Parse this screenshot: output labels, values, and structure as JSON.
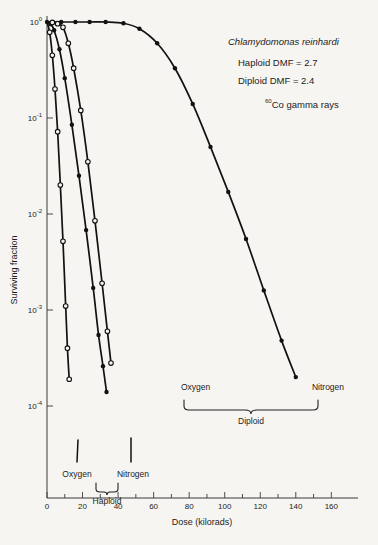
{
  "chart_data": {
    "type": "line",
    "title": "",
    "xlabel": "Dose (kilorads)",
    "ylabel": "Surviving fraction",
    "xlim": [
      0,
      175
    ],
    "ylim": [
      2e-05,
      1.2
    ],
    "yscale": "log",
    "grid": false,
    "legend_position": "none",
    "x_ticks_major": [
      0,
      20,
      40,
      60,
      80,
      100,
      120,
      140,
      160
    ],
    "x_tick_labels": [
      "0",
      "20",
      "40",
      "60",
      "80",
      "100",
      "120",
      "140",
      "160"
    ],
    "x_ticks_minor": [
      10,
      30,
      50,
      70,
      90,
      110,
      130,
      150
    ],
    "y_ticks": [
      1,
      0.1,
      0.01,
      0.001,
      0.0001
    ],
    "y_tick_labels": [
      "10",
      "10",
      "10",
      "10",
      "10"
    ],
    "y_tick_exponents": [
      "0",
      "-1",
      "-2",
      "-3",
      "-4"
    ],
    "series": [
      {
        "name": "Oxygen Haploid",
        "marker": "open-circle",
        "label": "Oxygen",
        "group": "Haploid",
        "x": [
          0,
          1.5,
          3,
          4.5,
          6,
          7.5,
          9,
          10.5,
          11.5,
          12.5
        ],
        "y": [
          1.0,
          0.78,
          0.45,
          0.2,
          0.072,
          0.02,
          0.0052,
          0.0011,
          0.0004,
          0.00019
        ]
      },
      {
        "name": "Nitrogen Haploid",
        "marker": "filled-circle",
        "label": "Nitrogen",
        "group": "Haploid",
        "x": [
          0,
          2,
          4,
          7,
          10,
          14,
          18,
          22,
          26,
          29,
          31.5,
          33.5
        ],
        "y": [
          1.0,
          0.95,
          0.82,
          0.52,
          0.26,
          0.085,
          0.025,
          0.0068,
          0.0017,
          0.00055,
          0.00026,
          0.00014
        ]
      },
      {
        "name": "Oxygen Diploid",
        "marker": "open-circle",
        "label": "Oxygen",
        "group": "Diploid",
        "x": [
          0,
          3,
          6,
          9,
          12,
          15,
          19,
          23,
          27,
          31,
          34,
          36
        ],
        "y": [
          1.0,
          0.99,
          0.96,
          0.88,
          0.6,
          0.33,
          0.12,
          0.035,
          0.0085,
          0.0019,
          0.0006,
          0.00028
        ]
      },
      {
        "name": "Nitrogen Diploid",
        "marker": "filled-circle",
        "label": "Nitrogen",
        "group": "Diploid",
        "x": [
          0,
          8,
          16,
          24,
          33,
          43,
          52,
          62,
          72,
          82,
          92,
          102,
          112,
          122,
          132,
          140
        ],
        "y": [
          1.0,
          1.0,
          1.0,
          1.0,
          1.0,
          0.97,
          0.85,
          0.6,
          0.33,
          0.14,
          0.05,
          0.017,
          0.0055,
          0.0016,
          0.00048,
          0.0002
        ]
      }
    ]
  },
  "annotation": {
    "species": "Chlamydomonas reinhardi",
    "haploid_dmf": "Haploid  DMF =  2.7",
    "diploid_dmf": "Diploid   DMF =  2.4",
    "source_sup": "60",
    "source_text": "Co gamma rays"
  },
  "group_labels": {
    "haploid": "Haploid",
    "diploid": "Diploid"
  },
  "axis": {
    "x_title": "Dose (kilorads)",
    "y_title": "Surviving fraction"
  }
}
